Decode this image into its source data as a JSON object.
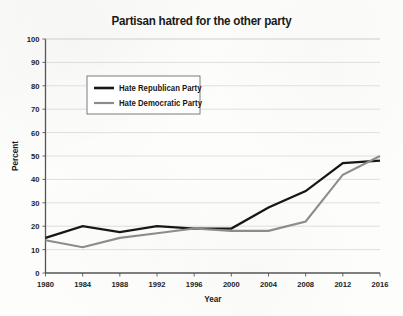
{
  "chart_data": {
    "type": "line",
    "title": "Partisan hatred for the other party",
    "xlabel": "Year",
    "ylabel": "Percent",
    "x": [
      1980,
      1984,
      1988,
      1992,
      1996,
      2000,
      2004,
      2008,
      2012,
      2016
    ],
    "xtick_labels": [
      "1980",
      "1984",
      "1988",
      "1992",
      "1996",
      "2000",
      "2004",
      "2008",
      "2012",
      "2016"
    ],
    "ytick_labels": [
      "0",
      "10",
      "20",
      "30",
      "40",
      "50",
      "60",
      "70",
      "80",
      "90",
      "100"
    ],
    "ytick_values": [
      0,
      10,
      20,
      30,
      40,
      50,
      60,
      70,
      80,
      90,
      100
    ],
    "xlim": [
      1980,
      2016
    ],
    "ylim": [
      0,
      100
    ],
    "grid": true,
    "grid_axis": "y",
    "legend_position": "upper left",
    "series": [
      {
        "name": "Hate Republican Party",
        "color": "#171717",
        "values": [
          15,
          20,
          17.5,
          20,
          19,
          19,
          28,
          35,
          47,
          48
        ]
      },
      {
        "name": "Hate Democratic Party",
        "color": "#8c8c8c",
        "values": [
          14,
          11,
          15,
          17,
          19,
          18,
          18,
          22,
          42,
          50
        ]
      }
    ]
  },
  "colors": {
    "background": "#fdfdfc",
    "axis": "#555555",
    "grid": "#d2d2d2",
    "text": "#1c1c1c",
    "legend_border": "#6e6e6e"
  }
}
